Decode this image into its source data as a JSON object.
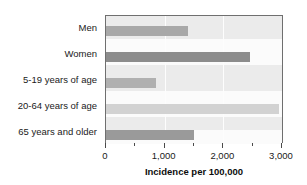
{
  "chart_data": {
    "type": "bar",
    "orientation": "horizontal",
    "title": "",
    "xlabel": "Incidence per 100,000",
    "ylabel": "",
    "xlim": [
      0,
      3000
    ],
    "xticks": [
      0,
      1000,
      2000,
      3000
    ],
    "xtick_labels": [
      "0",
      "1,000",
      "2,000",
      "3,000"
    ],
    "minor_xticks": [
      500,
      1500,
      2500
    ],
    "grid": true,
    "gridlines_at": [
      1000,
      2000
    ],
    "legend": null,
    "categories": [
      "Men",
      "Women",
      "5-19 years of age",
      "20-64 years of age",
      "65 years and older"
    ],
    "values": [
      1400,
      2450,
      850,
      2950,
      1500
    ],
    "bar_colors": [
      "#a8a8a8",
      "#8c8c8c",
      "#b0b0b0",
      "#d2d2d2",
      "#9a9a9a"
    ],
    "plot_background": "#ebebeb",
    "band_background": "#fbfbfb",
    "frame_color": "#6f6f6f"
  }
}
